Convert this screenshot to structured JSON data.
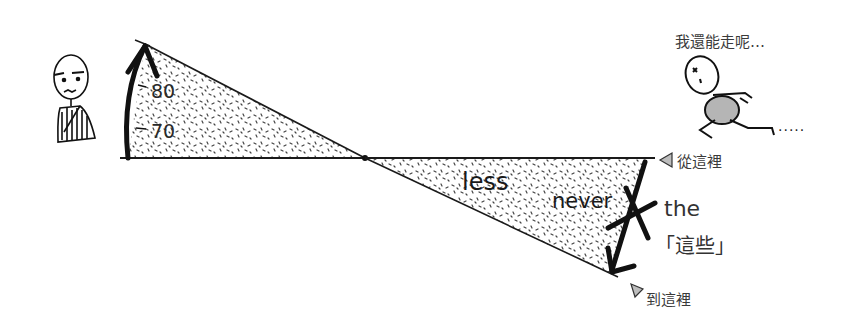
{
  "illustration": {
    "left_scale": {
      "label_upper": "80",
      "label_lower": "70"
    },
    "right_triangle": {
      "word_1": "less",
      "word_2": "never",
      "crossed_label": "the",
      "crossed_label_cjk": "「這些」",
      "start_marker": "從這裡",
      "end_marker": "到這裡"
    },
    "runner": {
      "speech": "我還能走呢…",
      "trail_dots": "·····"
    },
    "colors": {
      "ink": "#1a1a1a",
      "stipple": "#444444",
      "marker_fill": "#bdbdbd",
      "belly_fill": "#b5b5b5",
      "background": "#ffffff"
    }
  }
}
